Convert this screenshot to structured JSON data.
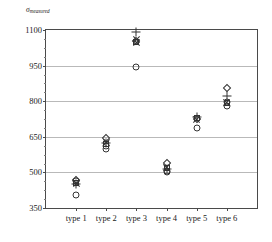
{
  "chart_data": {
    "type": "scatter",
    "title": "",
    "subtitle": "",
    "xlabel": "",
    "ylabel": "σ",
    "ylabel_sub": "measured",
    "ylim": [
      350,
      1100
    ],
    "xlim": [
      0,
      7
    ],
    "grid": true,
    "grid_axis": "y",
    "legend": "none",
    "yticks": [
      350,
      500,
      650,
      800,
      950,
      1100
    ],
    "ytick_labels": [
      "350",
      "500",
      "650",
      "800",
      "950",
      "1100"
    ],
    "y_minor_step": 37.5,
    "categories": [
      "type 1",
      "type 2",
      "type 3",
      "type 4",
      "type 5",
      "type 6"
    ],
    "marker_shapes": [
      "circle",
      "square",
      "diamond",
      "plus",
      "cross"
    ],
    "series": [
      {
        "name": "circle",
        "shape": "circle",
        "values": [
          405,
          600,
          945,
          500,
          685,
          780
        ]
      },
      {
        "name": "square",
        "shape": "square",
        "values": [
          455,
          620,
          1050,
          520,
          730,
          793
        ]
      },
      {
        "name": "diamond",
        "shape": "diamond",
        "values": [
          470,
          645,
          1055,
          540,
          725,
          855
        ]
      },
      {
        "name": "plus",
        "shape": "plus",
        "values": [
          450,
          625,
          1090,
          515,
          735,
          820
        ]
      },
      {
        "name": "cross",
        "shape": "cross",
        "values": [
          452,
          628,
          1048,
          522,
          722,
          795
        ]
      }
    ],
    "extra_points": [
      {
        "category": "type 1",
        "shape": "circle",
        "value": 462
      },
      {
        "category": "type 2",
        "shape": "circle",
        "value": 612
      },
      {
        "category": "type 3",
        "shape": "cross",
        "value": 1062
      },
      {
        "category": "type 4",
        "shape": "circle",
        "value": 508
      },
      {
        "category": "type 6",
        "shape": "circle",
        "value": 795
      }
    ]
  }
}
